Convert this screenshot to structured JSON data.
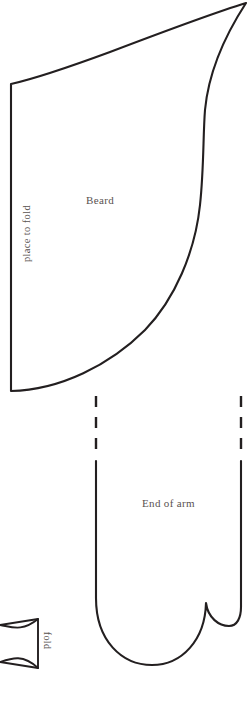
{
  "document": {
    "title": "Beard and Arm Sewing Pattern",
    "page_background": "#ffffff",
    "ink_color": "#231f20",
    "label_color": "#595250"
  },
  "labels": {
    "beard": "Beard",
    "place_to_fold": "place to fold",
    "end_of_arm": "End of arm",
    "fold": "fold"
  },
  "pieces": [
    {
      "name": "beard-piece",
      "label": "Beard",
      "edge_label": "place to fold",
      "edge_type": "straight-fold-edge"
    },
    {
      "name": "arm-piece",
      "label": "End of arm",
      "edge_type": "dashed-seam-allowance"
    },
    {
      "name": "fold-tab-piece",
      "label": "fold",
      "edge_type": "straight-fold-edge"
    }
  ]
}
